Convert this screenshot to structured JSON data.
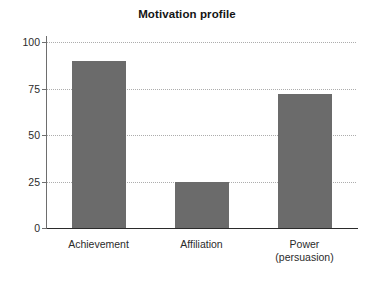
{
  "chart_data": {
    "type": "bar",
    "title": "Motivation profile",
    "categories": [
      "Achievement",
      "Affiliation",
      "Power\n(persuasion)"
    ],
    "category_labels_flat": [
      "Achievement",
      "Affiliation",
      "Power (persuasion)"
    ],
    "values": [
      90,
      25,
      72
    ],
    "xlabel": "",
    "ylabel": "",
    "ylim": [
      0,
      100
    ],
    "yticks": [
      0,
      25,
      50,
      75,
      100
    ],
    "ytick_labels": [
      "0",
      "25",
      "50",
      "75",
      "100"
    ],
    "grid": "horizontal-dotted",
    "legend": "none",
    "bar_color": "#6b6b6b",
    "gridline_color": "#adadad",
    "axis_color": "#2b2b2b",
    "background_color": "#ffffff"
  }
}
